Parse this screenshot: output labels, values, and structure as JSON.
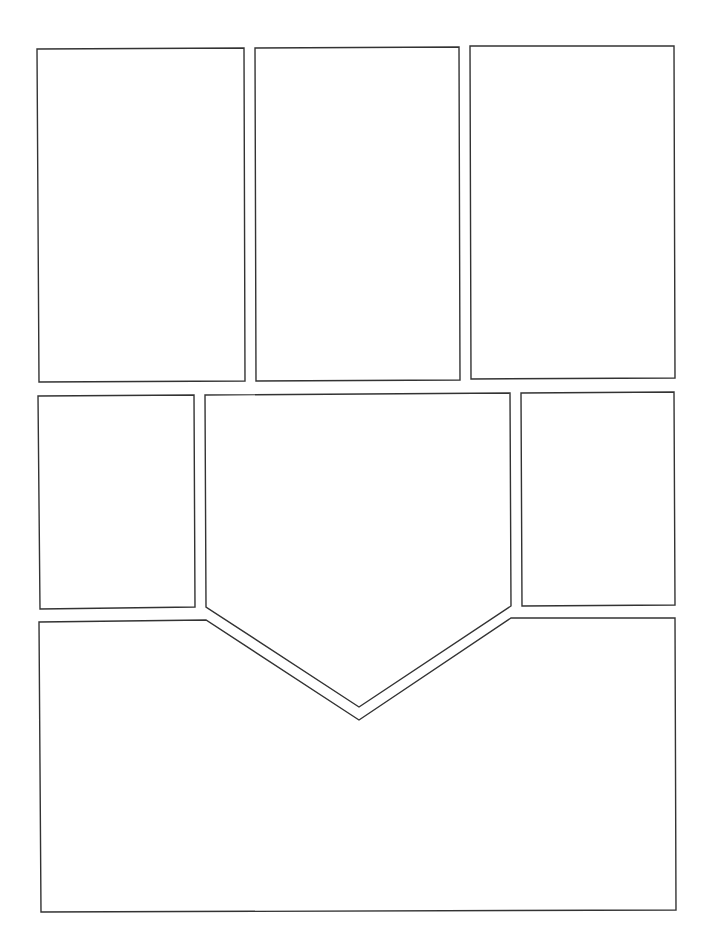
{
  "page": {
    "type": "comic-panel-layout-template",
    "background": "#ffffff",
    "stroke_color": "#333333"
  },
  "panels": [
    {
      "id": "panel-1",
      "row": 1,
      "shape": "rectangle",
      "points": "37,49 244,48 245,381 39,382"
    },
    {
      "id": "panel-2",
      "row": 1,
      "shape": "rectangle",
      "points": "255,48 459,47 460,380 256,381"
    },
    {
      "id": "panel-3",
      "row": 1,
      "shape": "rectangle",
      "points": "470,46 674,46 675,378 471,379"
    },
    {
      "id": "panel-4",
      "row": 2,
      "shape": "rectangle",
      "points": "38,396 194,395 195,607 40,609"
    },
    {
      "id": "panel-5",
      "row": 2,
      "shape": "pentagon-arrow",
      "points": "205,395 510,393 511,606 359,707 206,607"
    },
    {
      "id": "panel-6",
      "row": 2,
      "shape": "rectangle",
      "points": "521,393 674,392 675,605 522,606"
    },
    {
      "id": "panel-7",
      "row": 3,
      "shape": "notched-rectangle",
      "points": "39,622 206,620 359,720 511,618 675,618 676,910 41,912"
    }
  ]
}
